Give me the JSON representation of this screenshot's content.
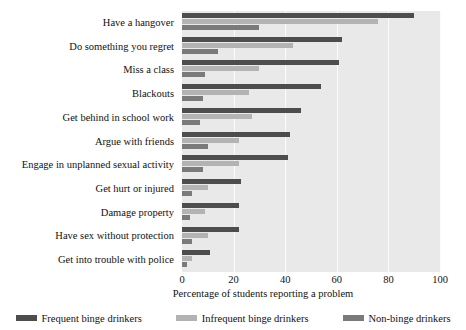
{
  "chart_data": {
    "type": "bar",
    "orientation": "horizontal",
    "title": "",
    "xlabel": "Percentage of students reporting a problem",
    "ylabel": "",
    "xlim": [
      0,
      100
    ],
    "xticks": [
      0,
      20,
      40,
      60,
      80,
      100
    ],
    "grid": true,
    "legend_position": "bottom",
    "categories": [
      "Have a hangover",
      "Do something you regret",
      "Miss a class",
      "Blackouts",
      "Get behind in school work",
      "Argue with friends",
      "Engage in unplanned sexual activity",
      "Get hurt or injured",
      "Damage property",
      "Have sex without protection",
      "Get into trouble with police"
    ],
    "series": [
      {
        "name": "Frequent binge drinkers",
        "color": "#4d4d4d",
        "values": [
          90,
          62,
          61,
          54,
          46,
          42,
          41,
          23,
          22,
          22,
          11
        ]
      },
      {
        "name": "Infrequent binge drinkers",
        "color": "#b3b3b3",
        "values": [
          76,
          43,
          30,
          26,
          27,
          22,
          22,
          10,
          9,
          10,
          4
        ]
      },
      {
        "name": "Non-binge drinkers",
        "color": "#7a7a7a",
        "values": [
          30,
          14,
          9,
          8,
          7,
          10,
          8,
          4,
          3,
          4,
          2
        ]
      }
    ]
  },
  "legend": {
    "items": [
      {
        "label": "Frequent binge drinkers",
        "color": "#4d4d4d"
      },
      {
        "label": "Infrequent binge drinkers",
        "color": "#b3b3b3"
      },
      {
        "label": "Non-binge drinkers",
        "color": "#7a7a7a"
      }
    ]
  },
  "colors": {
    "plot_background": "#e9e9e9",
    "gridline": "#fbfbfb",
    "text": "#111111",
    "page_background": "#ffffff"
  }
}
